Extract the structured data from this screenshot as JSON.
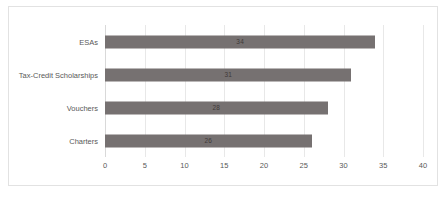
{
  "chart_data": {
    "type": "bar",
    "orientation": "horizontal",
    "title": "",
    "xlabel": "",
    "ylabel": "",
    "categories": [
      "Charters",
      "Vouchers",
      "Tax-Credit Scholarships",
      "ESAs"
    ],
    "values": [
      26,
      28,
      31,
      34
    ],
    "data_labels": [
      "26",
      "28",
      "31",
      "34"
    ],
    "xlim": [
      0,
      40
    ],
    "xticks": [
      0,
      5,
      10,
      15,
      20,
      25,
      30,
      35,
      40
    ],
    "xtick_labels": [
      "0",
      "5",
      "10",
      "15",
      "20",
      "25",
      "30",
      "35",
      "40"
    ],
    "grid": true,
    "grid_axis": "x",
    "legend": false,
    "bar_color": "#767171",
    "plot_background": "#ffffff",
    "border_color": "#e2e2e2",
    "gridline_color": "#e8e8e8",
    "label_color": "#595959",
    "value_label_color": "#3f3a39"
  }
}
